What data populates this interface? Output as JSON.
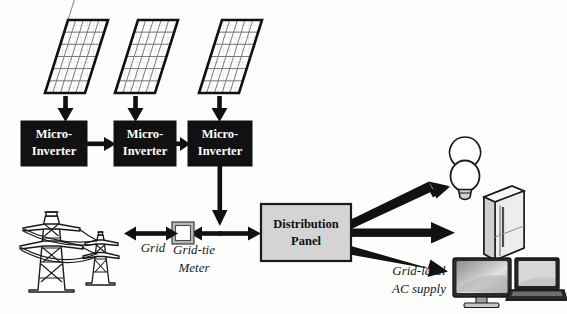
{
  "diagram": {
    "background_color": "#fdfdfb",
    "block_fill_dark": "#111111",
    "block_fill_light": "#d4d4d4",
    "stroke_color": "#111111"
  },
  "solar_panels": [
    {
      "name": "solar-panel-1",
      "cols": 5,
      "rows": 6
    },
    {
      "name": "solar-panel-2",
      "cols": 5,
      "rows": 6
    },
    {
      "name": "solar-panel-3",
      "cols": 5,
      "rows": 6
    }
  ],
  "inverters": [
    {
      "line1": "Micro-",
      "line2": "Inverter"
    },
    {
      "line1": "Micro-",
      "line2": "Inverter"
    },
    {
      "line1": "Micro-",
      "line2": "Inverter"
    }
  ],
  "distribution_panel": {
    "line1": "Distribution",
    "line2": "Panel"
  },
  "labels": {
    "grid": "Grid",
    "grid_tie_meter_line1": "Grid-tie",
    "grid_tie_meter_line2": "Meter",
    "grid_level_line1": "Grid-level",
    "grid_level_line2": "AC supply"
  },
  "loads": [
    {
      "name": "light-bulb-icon"
    },
    {
      "name": "refrigerator-icon"
    },
    {
      "name": "monitor-icon"
    },
    {
      "name": "laptop-icon"
    }
  ],
  "grid_source": {
    "name": "transmission-towers-icon",
    "tower_count": 2
  },
  "connections": [
    {
      "from": "solar-panel-1",
      "to": "inverter-1",
      "type": "arrow-down"
    },
    {
      "from": "solar-panel-2",
      "to": "inverter-2",
      "type": "arrow-down"
    },
    {
      "from": "solar-panel-3",
      "to": "inverter-3",
      "type": "arrow-down"
    },
    {
      "from": "inverter-1",
      "to": "inverter-2",
      "type": "arrow-right"
    },
    {
      "from": "inverter-2",
      "to": "inverter-3",
      "type": "arrow-right"
    },
    {
      "from": "inverter-3",
      "to": "bus",
      "type": "arrow-down"
    },
    {
      "from": "bus",
      "to": "grid-tie-meter",
      "type": "arrow-left"
    },
    {
      "from": "grid-tie-meter",
      "to": "transmission-towers",
      "type": "arrow-bidirectional"
    },
    {
      "from": "bus",
      "to": "distribution-panel",
      "type": "arrow-right"
    },
    {
      "from": "distribution-panel",
      "to": "light-bulb",
      "type": "arrow-diagonal-up"
    },
    {
      "from": "distribution-panel",
      "to": "refrigerator",
      "type": "arrow-right"
    },
    {
      "from": "distribution-panel",
      "to": "monitor",
      "type": "arrow-diagonal-down"
    }
  ]
}
